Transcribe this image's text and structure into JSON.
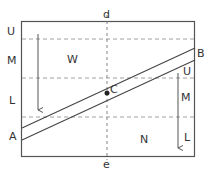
{
  "diagram": {
    "frame": {
      "x": 21,
      "y": 21,
      "width": 174,
      "height": 136,
      "stroke": "#555555"
    },
    "colors": {
      "line": "#555555",
      "dash": "#888888",
      "text": "#333333"
    },
    "vertical_axis": {
      "top_label": "d",
      "bottom_label": "e"
    },
    "band": {
      "start_label": "A",
      "end_label": "B",
      "center_label": "C"
    },
    "regions": {
      "upper_left": "W",
      "lower_right": "N"
    },
    "left_scale": {
      "labels": [
        "U",
        "M",
        "L"
      ]
    },
    "right_scale": {
      "labels": [
        "U",
        "M",
        "L"
      ]
    }
  }
}
